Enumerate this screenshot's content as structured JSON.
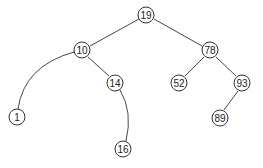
{
  "diagram": {
    "type": "binary-search-tree",
    "nodes": [
      {
        "id": "n19",
        "label": "19",
        "x": 146,
        "y": 15
      },
      {
        "id": "n10",
        "label": "10",
        "x": 82,
        "y": 50
      },
      {
        "id": "n78",
        "label": "78",
        "x": 210,
        "y": 50
      },
      {
        "id": "n14",
        "label": "14",
        "x": 115,
        "y": 83
      },
      {
        "id": "n52",
        "label": "52",
        "x": 179,
        "y": 83
      },
      {
        "id": "n93",
        "label": "93",
        "x": 242,
        "y": 83
      },
      {
        "id": "n1",
        "label": "1",
        "x": 17,
        "y": 117
      },
      {
        "id": "n89",
        "label": "89",
        "x": 220,
        "y": 118
      },
      {
        "id": "n16",
        "label": "16",
        "x": 123,
        "y": 149
      }
    ],
    "edges": [
      {
        "from": "n19",
        "to": "n10",
        "shape": "line"
      },
      {
        "from": "n19",
        "to": "n78",
        "shape": "line"
      },
      {
        "from": "n10",
        "to": "n1",
        "shape": "curve"
      },
      {
        "from": "n10",
        "to": "n14",
        "shape": "line"
      },
      {
        "from": "n14",
        "to": "n16",
        "shape": "curve"
      },
      {
        "from": "n78",
        "to": "n52",
        "shape": "line"
      },
      {
        "from": "n78",
        "to": "n93",
        "shape": "line"
      },
      {
        "from": "n93",
        "to": "n89",
        "shape": "line"
      }
    ],
    "style": {
      "stroke": "#333333",
      "fill": "#ffffff",
      "node_radius": 8
    }
  }
}
